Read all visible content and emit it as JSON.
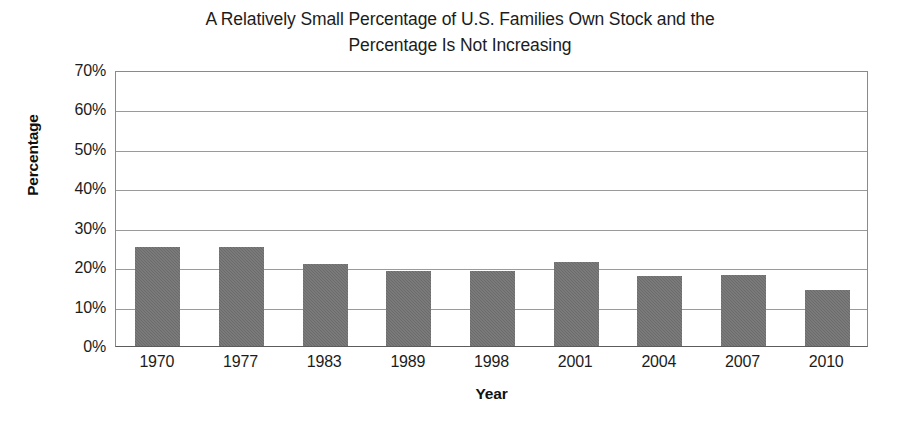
{
  "chart_data": {
    "type": "bar",
    "title": "A Relatively Small Percentage of U.S. Families Own Stock and the Percentage Is Not Increasing",
    "title_line1": "A Relatively Small Percentage of U.S. Families Own Stock and the",
    "title_line2": "Percentage Is Not Increasing",
    "xlabel": "Year",
    "ylabel": "Percentage",
    "categories": [
      "1970",
      "1977",
      "1983",
      "1989",
      "1998",
      "2001",
      "2004",
      "2007",
      "2010"
    ],
    "values": [
      25.2,
      25.2,
      20.8,
      19.0,
      19.0,
      21.3,
      17.7,
      18.0,
      14.2
    ],
    "ytick_labels": [
      "0%",
      "10%",
      "20%",
      "30%",
      "40%",
      "50%",
      "60%",
      "70%"
    ],
    "ytick_values": [
      0,
      10,
      20,
      30,
      40,
      50,
      60,
      70
    ],
    "ylim": [
      0,
      70
    ],
    "grid": "horizontal",
    "legend": "none",
    "bar_color": "#6b6b6b",
    "gridline_color": "#9a9a9a",
    "axis_color": "#8a8a8a",
    "background_color": "#ffffff",
    "text_color": "#1c1c1c"
  }
}
